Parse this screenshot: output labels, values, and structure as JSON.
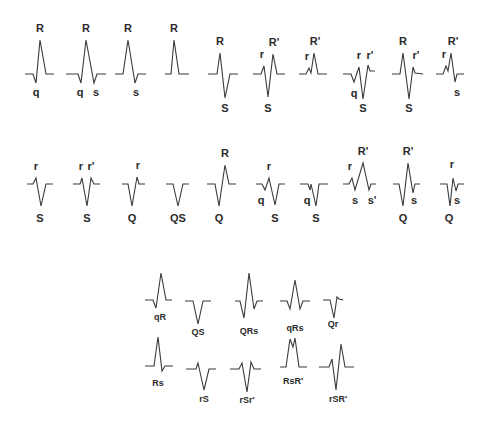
{
  "colors": {
    "background": "#ffffff",
    "stroke": "#3a3a3a",
    "text": "#2a2a2a"
  },
  "top_row": [
    {
      "id": "qR",
      "ox": 25,
      "base": 74,
      "pts": [
        [
          0,
          0
        ],
        [
          8,
          0
        ],
        [
          11,
          9
        ],
        [
          15,
          -34
        ],
        [
          21,
          0
        ],
        [
          29,
          0
        ]
      ],
      "labels": [
        [
          "R",
          15,
          -42,
          "big"
        ],
        [
          "q",
          11,
          22,
          "big"
        ]
      ]
    },
    {
      "id": "qRs",
      "ox": 66,
      "base": 74,
      "pts": [
        [
          0,
          0
        ],
        [
          12,
          0
        ],
        [
          15,
          9
        ],
        [
          20,
          -34
        ],
        [
          28,
          9
        ],
        [
          31,
          0
        ],
        [
          40,
          0
        ]
      ],
      "labels": [
        [
          "R",
          20,
          -42,
          "big"
        ],
        [
          "q",
          14,
          22,
          "big"
        ],
        [
          "s",
          30,
          22,
          "big"
        ]
      ]
    },
    {
      "id": "Rs",
      "ox": 115,
      "base": 74,
      "pts": [
        [
          0,
          0
        ],
        [
          8,
          0
        ],
        [
          13,
          -34
        ],
        [
          20,
          9
        ],
        [
          23,
          0
        ],
        [
          31,
          0
        ]
      ],
      "labels": [
        [
          "R",
          13,
          -42,
          "big"
        ],
        [
          "s",
          21,
          22,
          "big"
        ]
      ]
    },
    {
      "id": "R",
      "ox": 165,
      "base": 74,
      "pts": [
        [
          0,
          0
        ],
        [
          6,
          0
        ],
        [
          9,
          -34
        ],
        [
          14,
          0
        ],
        [
          24,
          0
        ]
      ],
      "labels": [
        [
          "R",
          9,
          -42,
          "big"
        ]
      ]
    },
    {
      "id": "RS",
      "ox": 208,
      "base": 74,
      "pts": [
        [
          0,
          0
        ],
        [
          9,
          0
        ],
        [
          12,
          -21
        ],
        [
          17,
          24
        ],
        [
          22,
          0
        ],
        [
          30,
          0
        ]
      ],
      "labels": [
        [
          "R",
          12,
          -29,
          "big"
        ],
        [
          "S",
          17,
          38,
          "big"
        ]
      ]
    },
    {
      "id": "rSR'",
      "ox": 253,
      "base": 74,
      "pts": [
        [
          0,
          0
        ],
        [
          8,
          0
        ],
        [
          11,
          -8
        ],
        [
          15,
          23
        ],
        [
          20,
          -20
        ],
        [
          24,
          0
        ],
        [
          32,
          0
        ]
      ],
      "labels": [
        [
          "r",
          9,
          -16,
          "big"
        ],
        [
          "R'",
          21,
          -28,
          "big"
        ],
        [
          "S",
          15,
          38,
          "big"
        ]
      ]
    },
    {
      "id": "rR'",
      "ox": 299,
      "base": 74,
      "pts": [
        [
          0,
          0
        ],
        [
          7,
          0
        ],
        [
          10,
          -6
        ],
        [
          12,
          -1
        ],
        [
          15,
          -21
        ],
        [
          19,
          0
        ],
        [
          28,
          0
        ]
      ],
      "labels": [
        [
          "r",
          8,
          -14,
          "big"
        ],
        [
          "R'",
          16,
          -29,
          "big"
        ],
        [
          "S",
          0,
          0,
          "hidden"
        ]
      ]
    },
    {
      "id": "qrSr'",
      "ox": 343,
      "base": 74,
      "pts": [
        [
          0,
          0
        ],
        [
          8,
          0
        ],
        [
          11,
          8
        ],
        [
          16,
          -7
        ],
        [
          20,
          25
        ],
        [
          25,
          -9
        ],
        [
          27,
          -3
        ],
        [
          32,
          -3
        ]
      ],
      "labels": [
        [
          "q",
          11,
          23,
          "big"
        ],
        [
          "r",
          16,
          -15,
          "big"
        ],
        [
          "r'",
          27,
          -15,
          "big"
        ],
        [
          "S",
          20,
          38,
          "big"
        ]
      ]
    },
    {
      "id": "RSr'",
      "ox": 392,
      "base": 74,
      "pts": [
        [
          0,
          0
        ],
        [
          8,
          0
        ],
        [
          11,
          -21
        ],
        [
          17,
          25
        ],
        [
          21,
          -7
        ],
        [
          23,
          -1
        ],
        [
          31,
          0
        ]
      ],
      "labels": [
        [
          "R",
          11,
          -29,
          "big"
        ],
        [
          "r'",
          24,
          -15,
          "big"
        ],
        [
          "S",
          17,
          38,
          "big"
        ]
      ]
    },
    {
      "id": "rR's",
      "ox": 436,
      "base": 74,
      "pts": [
        [
          0,
          0
        ],
        [
          7,
          0
        ],
        [
          10,
          -8
        ],
        [
          12,
          -3
        ],
        [
          15,
          -21
        ],
        [
          19,
          8
        ],
        [
          21,
          0
        ],
        [
          28,
          0
        ]
      ],
      "labels": [
        [
          "r",
          8,
          -16,
          "big"
        ],
        [
          "R'",
          17,
          -29,
          "big"
        ],
        [
          "s",
          21,
          22,
          "big"
        ]
      ]
    }
  ],
  "middle_row": [
    {
      "id": "rS",
      "ox": 27,
      "base": 184,
      "pts": [
        [
          0,
          0
        ],
        [
          6,
          0
        ],
        [
          9,
          -6
        ],
        [
          14,
          22
        ],
        [
          19,
          0
        ],
        [
          26,
          0
        ]
      ],
      "labels": [
        [
          "r",
          9,
          -14,
          "big"
        ],
        [
          "S",
          13,
          38,
          "big"
        ]
      ]
    },
    {
      "id": "rSr'",
      "ox": 73,
      "base": 184,
      "pts": [
        [
          0,
          0
        ],
        [
          7,
          0
        ],
        [
          9,
          -6
        ],
        [
          14,
          22
        ],
        [
          18,
          -6
        ],
        [
          21,
          0
        ],
        [
          27,
          0
        ]
      ],
      "labels": [
        [
          "r",
          8,
          -14,
          "big"
        ],
        [
          "r'",
          18,
          -14,
          "big"
        ],
        [
          "S",
          14,
          38,
          "big"
        ]
      ]
    },
    {
      "id": "Qr",
      "ox": 122,
      "base": 184,
      "pts": [
        [
          0,
          0
        ],
        [
          6,
          0
        ],
        [
          10,
          22
        ],
        [
          15,
          -7
        ],
        [
          17,
          0
        ],
        [
          23,
          0
        ]
      ],
      "labels": [
        [
          "r",
          16,
          -15,
          "big"
        ],
        [
          "Q",
          10,
          38,
          "big"
        ]
      ]
    },
    {
      "id": "QS",
      "ox": 166,
      "base": 184,
      "pts": [
        [
          0,
          0
        ],
        [
          7,
          0
        ],
        [
          12,
          22
        ],
        [
          17,
          0
        ],
        [
          23,
          0
        ]
      ],
      "labels": [
        [
          "QS",
          12,
          38,
          "big"
        ]
      ]
    },
    {
      "id": "QR",
      "ox": 207,
      "base": 184,
      "pts": [
        [
          0,
          0
        ],
        [
          8,
          0
        ],
        [
          12,
          22
        ],
        [
          18,
          -19
        ],
        [
          22,
          0
        ],
        [
          29,
          0
        ]
      ],
      "labels": [
        [
          "R",
          18,
          -27,
          "big"
        ],
        [
          "Q",
          12,
          38,
          "big"
        ]
      ]
    },
    {
      "id": "qrS",
      "ox": 256,
      "base": 184,
      "pts": [
        [
          0,
          0
        ],
        [
          6,
          0
        ],
        [
          9,
          6
        ],
        [
          13,
          -6
        ],
        [
          19,
          21
        ],
        [
          23,
          0
        ],
        [
          29,
          0
        ]
      ],
      "labels": [
        [
          "r",
          13,
          -14,
          "big"
        ],
        [
          "q",
          5,
          20,
          "big"
        ],
        [
          "S",
          19,
          38,
          "big"
        ]
      ]
    },
    {
      "id": "qS",
      "ox": 300,
      "base": 184,
      "pts": [
        [
          0,
          0
        ],
        [
          8,
          0
        ],
        [
          10,
          6
        ],
        [
          11,
          0
        ],
        [
          16,
          22
        ],
        [
          19,
          0
        ],
        [
          28,
          0
        ]
      ],
      "labels": [
        [
          "q",
          7,
          20,
          "big"
        ],
        [
          "S",
          16,
          38,
          "big"
        ]
      ]
    },
    {
      "id": "rsR's'",
      "ox": 343,
      "base": 184,
      "pts": [
        [
          0,
          0
        ],
        [
          6,
          0
        ],
        [
          9,
          -6
        ],
        [
          12,
          6
        ],
        [
          20,
          -21
        ],
        [
          26,
          6
        ],
        [
          28,
          0
        ],
        [
          33,
          0
        ]
      ],
      "labels": [
        [
          "r",
          7,
          -14,
          "big"
        ],
        [
          "s",
          12,
          20,
          "big"
        ],
        [
          "R'",
          20,
          -29,
          "big"
        ],
        [
          "s'",
          29,
          20,
          "big"
        ]
      ]
    },
    {
      "id": "QR's",
      "ox": 393,
      "base": 184,
      "pts": [
        [
          0,
          0
        ],
        [
          6,
          0
        ],
        [
          10,
          22
        ],
        [
          15,
          -21
        ],
        [
          20,
          9
        ],
        [
          22,
          0
        ],
        [
          27,
          0
        ]
      ],
      "labels": [
        [
          "R'",
          15,
          -29,
          "big"
        ],
        [
          "Q",
          10,
          38,
          "big"
        ],
        [
          "s",
          21,
          20,
          "big"
        ]
      ]
    },
    {
      "id": "Qrs",
      "ox": 440,
      "base": 184,
      "pts": [
        [
          0,
          0
        ],
        [
          7,
          0
        ],
        [
          10,
          22
        ],
        [
          13,
          -6
        ],
        [
          16,
          7
        ],
        [
          18,
          0
        ],
        [
          24,
          0
        ]
      ],
      "labels": [
        [
          "r",
          12,
          -16,
          "big"
        ],
        [
          "Q",
          9,
          38,
          "big"
        ],
        [
          "s",
          17,
          20,
          "big"
        ]
      ]
    }
  ],
  "bottom_grid": [
    {
      "id": "qR",
      "name": "qR",
      "ox": 145,
      "base": 300,
      "pts": [
        [
          0,
          0
        ],
        [
          8,
          0
        ],
        [
          11,
          8
        ],
        [
          16,
          -27
        ],
        [
          21,
          0
        ],
        [
          27,
          0
        ]
      ],
      "labels": [
        [
          "qR",
          15,
          20,
          "small"
        ]
      ]
    },
    {
      "id": "QS",
      "name": "QS",
      "ox": 185,
      "base": 301,
      "pts": [
        [
          0,
          0
        ],
        [
          8,
          0
        ],
        [
          13,
          23
        ],
        [
          18,
          0
        ],
        [
          26,
          0
        ]
      ],
      "labels": [
        [
          "QS",
          13,
          34,
          "small"
        ]
      ]
    },
    {
      "id": "QRs",
      "name": "QRs",
      "ox": 235,
      "base": 301,
      "pts": [
        [
          0,
          0
        ],
        [
          5,
          0
        ],
        [
          9,
          17
        ],
        [
          14,
          -28
        ],
        [
          19,
          8
        ],
        [
          22,
          0
        ],
        [
          28,
          0
        ]
      ],
      "labels": [
        [
          "QRs",
          14,
          33,
          "small"
        ]
      ]
    },
    {
      "id": "qRs",
      "name": "qRs",
      "ox": 280,
      "base": 301,
      "pts": [
        [
          0,
          0
        ],
        [
          7,
          0
        ],
        [
          10,
          8
        ],
        [
          15,
          -21
        ],
        [
          20,
          8
        ],
        [
          23,
          0
        ],
        [
          30,
          0
        ]
      ],
      "labels": [
        [
          "qRs",
          15,
          30,
          "small"
        ]
      ]
    },
    {
      "id": "Qr",
      "name": "Qr",
      "ox": 323,
      "base": 300,
      "pts": [
        [
          0,
          0
        ],
        [
          7,
          0
        ],
        [
          11,
          18
        ],
        [
          14,
          -3
        ],
        [
          16,
          -1
        ],
        [
          20,
          0
        ]
      ],
      "labels": [
        [
          "Qr",
          10,
          27,
          "small"
        ]
      ]
    },
    {
      "id": "Rs",
      "name": "Rs",
      "ox": 145,
      "base": 366,
      "pts": [
        [
          0,
          0
        ],
        [
          9,
          0
        ],
        [
          13,
          -29
        ],
        [
          17,
          5
        ],
        [
          20,
          0
        ],
        [
          28,
          0
        ]
      ],
      "labels": [
        [
          "Rs",
          13,
          20,
          "small"
        ]
      ]
    },
    {
      "id": "rS",
      "name": "rS",
      "ox": 186,
      "base": 369,
      "pts": [
        [
          0,
          0
        ],
        [
          10,
          0
        ],
        [
          12,
          -6
        ],
        [
          18,
          21
        ],
        [
          23,
          0
        ],
        [
          30,
          0
        ]
      ],
      "labels": [
        [
          "rS",
          18,
          33,
          "small"
        ]
      ]
    },
    {
      "id": "rSr'",
      "name": "rSr'",
      "ox": 230,
      "base": 369,
      "pts": [
        [
          0,
          0
        ],
        [
          9,
          0
        ],
        [
          12,
          -6
        ],
        [
          17,
          23
        ],
        [
          21,
          -7
        ],
        [
          24,
          0
        ],
        [
          31,
          0
        ]
      ],
      "labels": [
        [
          "rSr'",
          17,
          34,
          "small"
        ]
      ]
    },
    {
      "id": "RsR'",
      "name": "RsR'",
      "ox": 280,
      "base": 367,
      "pts": [
        [
          0,
          0
        ],
        [
          6,
          0
        ],
        [
          10,
          -28
        ],
        [
          13,
          -20
        ],
        [
          15,
          -29
        ],
        [
          19,
          0
        ],
        [
          27,
          0
        ]
      ],
      "labels": [
        [
          "RsR'",
          13,
          17,
          "small"
        ]
      ]
    },
    {
      "id": "rSR'",
      "name": "rSR'",
      "ox": 319,
      "base": 367,
      "pts": [
        [
          0,
          0
        ],
        [
          10,
          0
        ],
        [
          13,
          -8
        ],
        [
          17,
          23
        ],
        [
          22,
          -23
        ],
        [
          26,
          0
        ],
        [
          35,
          0
        ]
      ],
      "labels": [
        [
          "rSR'",
          19,
          35,
          "small"
        ]
      ]
    }
  ]
}
